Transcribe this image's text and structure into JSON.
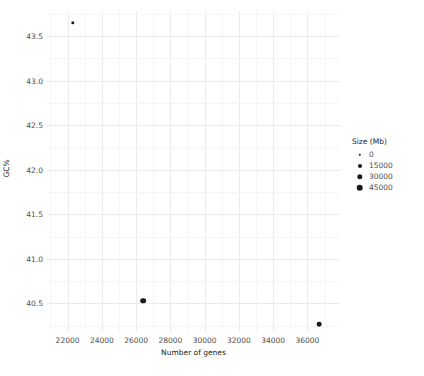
{
  "chart_data": {
    "type": "scatter",
    "title": "",
    "xlabel": "Number of genes",
    "ylabel": "GC%",
    "xlim": [
      20800,
      37900
    ],
    "ylim": [
      40.18,
      43.78
    ],
    "xticks": [
      22000,
      24000,
      26000,
      28000,
      30000,
      32000,
      34000,
      36000
    ],
    "xtick_labels": [
      "22000",
      "24000",
      "26000",
      "28000",
      "30000",
      "32000",
      "34000",
      "36000"
    ],
    "yticks": [
      40.5,
      41.0,
      41.5,
      42.0,
      42.5,
      43.0,
      43.5
    ],
    "ytick_labels": [
      "40.5",
      "41.0",
      "41.5",
      "42.0",
      "42.5",
      "43.0",
      "43.5"
    ],
    "grid": true,
    "grid_major_color": "#ebebeb",
    "grid_minor_color": "#f5f5f5",
    "background": "#ffffff",
    "point_color": "#1a1a1a",
    "size_variable": "Size (Mb)",
    "points": [
      {
        "x": 22300,
        "y": 43.65,
        "size": 3000
      },
      {
        "x": 26400,
        "y": 40.53,
        "size": 24000
      },
      {
        "x": 36700,
        "y": 40.27,
        "size": 12000
      }
    ],
    "legend": {
      "position": "right",
      "title": "Size (Mb)",
      "entries": [
        {
          "label": "0",
          "value": 0,
          "radius_px": 1.2
        },
        {
          "label": "15000",
          "value": 15000,
          "radius_px": 2.0
        },
        {
          "label": "30000",
          "value": 30000,
          "radius_px": 2.7
        },
        {
          "label": "45000",
          "value": 45000,
          "radius_px": 3.3
        }
      ]
    }
  }
}
